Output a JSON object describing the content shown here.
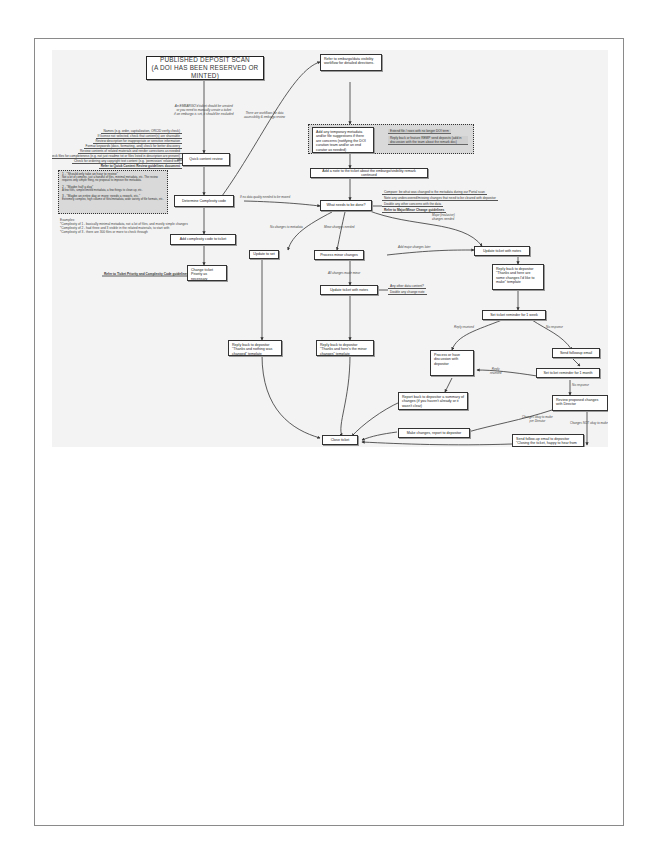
{
  "page": {
    "frame_color": "#8a8a8a",
    "scan_background": "#f3f3f3"
  },
  "diagram": {
    "title": {
      "line1": "PUBLISHED DEPOSIT SCAN",
      "line2": "(A DOI HAS BEEN RESERVED OR MINTED)"
    },
    "start_note": {
      "line1": "An EMBARGO'd ticket should be created",
      "line2": "or you need to manually create a ticket",
      "line3": "if an embargo is set, it should be excluded"
    },
    "quick_review": {
      "label": "Quick content review",
      "checks": [
        "Names (e.g. order, capitalization, ORCID verify check)",
        "If license not selected, check that content(s) are shareable",
        "Review description for inappropriate or sensitive information",
        "Format keywords (docs, formatting, and) check for better discovery",
        "Review contents of related materials and render corrections as needed",
        "Check files for completeness (e.g. not just readme txt or files listed in description are present)",
        "Check for ordering any copyright text content (e.g. 'permission' related text)",
        "Refer to Quick Content Review guidelines document"
      ]
    },
    "embargo_link_label": {
      "line1": "There are workflows for data",
      "line2": "accessibility & embargo review"
    },
    "determine_complexity": {
      "label": "Determine Complexity code",
      "options": [
        {
          "title": "1 - \"Should only take an hour to review\"",
          "body": "Not a lot of complex, just a handful of files, minimal metadata, etc. The review requires only simple thing, no proposal to improve the metadata."
        },
        {
          "title": "2 - \"Maybe half a day\"",
          "body": "A few files, simple/limited metadata, a few things to clean up, etc."
        },
        {
          "title": "3 - \"Maybe an entire day or more; needs a rework, etc.\"",
          "body": "Extremely complex, high volume of files/metadata, wide variety of file formats, etc."
        }
      ]
    },
    "complexity_examples": {
      "header": "Examples:",
      "lines": [
        "*Complexity of 1 - basically minimal metadata, not a lot of files, and mostly simple changes",
        "*Complexity of 2 - had three and 3 visible in the related materials, to start with",
        "*Complexity of 3 - there are 300 files or more to check through"
      ]
    },
    "add_complexity": {
      "label": "Add complexity code to ticket"
    },
    "change_priority": {
      "label": "Change ticket Priority as necessary",
      "guideline": "Refer to Ticket Priority and Complexity Code guidelines"
    },
    "refer_embargo": {
      "label": "Refer to embargo/data visibility workflow for detailed directions."
    },
    "add_metadata": {
      "label": "Add any temporary metadata and/or file suggestions if there are concerns (notifying the DOI curation team and/or an end curator as needed)",
      "side_items": [
        "Extend file / rows with no longer DOI term",
        "Reply back or feature REMP send deposits (add in discussion with the team about the remark doc)"
      ]
    },
    "add_note": {
      "label": "Add a note to the ticket about the embargo/visibility remark continued"
    },
    "what_needs": {
      "label": "What needs to be done?",
      "incoming_label": "If no data quality needed to be moved",
      "checks": [
        "Compare: be what was changed to the metadata during our Portal scan",
        "Note any undercovered/missing changes that need to be cleared with depositor",
        "Double any other concerns with the data",
        "Refer to Major/Minor Change guidelines"
      ]
    },
    "branches": {
      "no_changes": "No changes to metadata",
      "minor": "Minor changes needed",
      "major": {
        "line1": "Major (exclusive)",
        "line2": "changes needed"
      }
    },
    "update_to_set": {
      "label": "Update to set"
    },
    "process_minor": {
      "label": "Process minor changes",
      "to_major_label": "Add major changes later"
    },
    "all_minor": {
      "label": "All changes made minor"
    },
    "update_notes_minor": {
      "label": "Update ticket with notes",
      "side_items": [
        "Any other data content?",
        "Double any change note"
      ]
    },
    "update_notes_major": {
      "label": "Update ticket with notes"
    },
    "reply_major": {
      "label": "Reply back to depositor \"Thanks and here are some changes I'd like to make\" template"
    },
    "set_reminder_week": {
      "label": "Set ticket reminder for 1 week"
    },
    "reply_empty": {
      "label": "Reply back to depositor \"Thanks and nothing was changed\" template"
    },
    "reply_minor": {
      "label": "Reply back to depositor \"Thanks and here's the minor changes\" template"
    },
    "reply_received": "Reply received",
    "no_response": "No response",
    "process_or_discuss": {
      "label": "Process or have discussion with depositor"
    },
    "send_followup": {
      "label": "Send followup email"
    },
    "reply_received_2": {
      "line1": "Reply",
      "line2": "received"
    },
    "set_reminder_month": {
      "label": "Set ticket reminder for 1 month"
    },
    "no_response_2": "No response",
    "report_back": {
      "label": "Report back to depositor a summary of changes (if you haven't already or it wasn't clear)"
    },
    "review_proposed": {
      "label": "Review proposed changes with Director"
    },
    "changes_okay": {
      "line1": "Changes okay to make",
      "line2": "per Director"
    },
    "changes_not_okay": "Changes NOT okay to make",
    "make_changes": {
      "label": "Make changes, report to depositor"
    },
    "close_ticket": {
      "label": "Close ticket"
    },
    "send_close": {
      "label": "Send follow-up email to depositor \"Closing the ticket, happy to hear from you...\" template"
    }
  }
}
